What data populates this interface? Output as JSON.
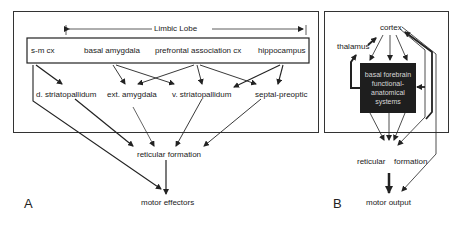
{
  "panel_a": {
    "letter": "A",
    "bracket_label": "Limbic Lobe",
    "top_row": [
      "s-m cx",
      "basal amygdala",
      "prefrontal association cx",
      "hippocampus"
    ],
    "middle_row": [
      "d. striatopallidum",
      "ext. amygdala",
      "v. striatopallidum",
      "septal-preoptic"
    ],
    "reticular": "reticular formation",
    "output": "motor effectors"
  },
  "panel_b": {
    "letter": "B",
    "cortex": "cortex",
    "thalamus": "thalamus",
    "box_lines": [
      "basal forebrain",
      "functional-",
      "anatomical",
      "systems"
    ],
    "reticular_left": "reticular",
    "reticular_right": "formation",
    "output": "motor output"
  },
  "colors": {
    "line": "#222222",
    "box_fill": "#1e1e1e",
    "box_text": "#d8d8d8",
    "border": "#333333"
  }
}
